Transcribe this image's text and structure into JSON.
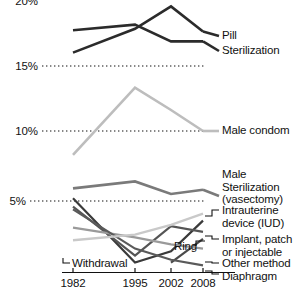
{
  "chart_data": {
    "type": "line",
    "title": "",
    "xlabel": "",
    "ylabel": "",
    "x": [
      1982,
      1995,
      2002,
      2008
    ],
    "xtick_labels": [
      "1982",
      "1995",
      "2002",
      "2008"
    ],
    "ytick_labels": [
      "20%",
      "15%",
      "10%",
      "5%"
    ],
    "ytick_values": [
      20,
      15,
      10,
      5
    ],
    "ylim": [
      0,
      20.2
    ],
    "xlim": [
      1982,
      2008
    ],
    "grid": "horizontal-dotted",
    "legend_position": "right-inline-labels",
    "series": [
      {
        "name": "Pill",
        "label": "Pill",
        "color": "#2b2b2b",
        "width": 2.6,
        "values": [
          15.6,
          17.3,
          18.9,
          17.1
        ]
      },
      {
        "name": "Sterilization",
        "label": "Sterilization",
        "color": "#2b2b2b",
        "width": 2.6,
        "values": [
          17.2,
          17.6,
          16.4,
          16.4
        ]
      },
      {
        "name": "Male condom",
        "label": "Male condom",
        "color": "#bdbdbd",
        "width": 2.6,
        "values": [
          8.3,
          13.1,
          11.5,
          10.0
        ]
      },
      {
        "name": "Male Sterilization (vasectomy)",
        "label": "Male\nSterilization\n(vasectomy)",
        "color": "#7a7a7a",
        "width": 2.6,
        "values": [
          5.9,
          6.4,
          5.5,
          5.8
        ]
      },
      {
        "name": "Intrauterine device (IUD)",
        "label": "Intrauterine\ndevice (IUD)",
        "color": "#3a3a3a",
        "width": 2.2,
        "values": [
          5.2,
          0.6,
          1.4,
          3.6
        ]
      },
      {
        "name": "Implant, patch or injectable",
        "label": "Implant, patch\nor injectable",
        "color": "#555555",
        "width": 2.2,
        "values": [
          4.6,
          1.1,
          3.2,
          2.8
        ]
      },
      {
        "name": "Ring",
        "label": "Ring",
        "color": "#4a4a4a",
        "width": 2.2,
        "values": [
          0.0,
          0.0,
          0.6,
          2.3
        ]
      },
      {
        "name": "Other method",
        "label": "Other method",
        "color": "#9a9a9a",
        "width": 2.2,
        "values": [
          3.1,
          2.4,
          1.9,
          1.6
        ]
      },
      {
        "name": "Diaphragm",
        "label": "Diaphragm",
        "color": "#5a5a5a",
        "width": 2.2,
        "values": [
          4.4,
          1.6,
          0.8,
          0.4
        ]
      },
      {
        "name": "Withdrawal",
        "label": "Withdrawal",
        "color": "#c9c9c9",
        "width": 2.4,
        "values": [
          2.2,
          2.6,
          3.3,
          4.1
        ]
      }
    ]
  },
  "axis": {
    "y_labels": [
      "20%",
      "15%",
      "10%",
      "5%"
    ],
    "x_labels": [
      "1982",
      "1995",
      "2002",
      "2008"
    ]
  },
  "labels": {
    "pill": "Pill",
    "sterilization": "Sterilization",
    "male_condom": "Male condom",
    "male_sterilization": "Male\nSterilization\n(vasectomy)",
    "iud": "Intrauterine\ndevice (IUD)",
    "implant": "Implant, patch\nor injectable",
    "ring": "Ring",
    "other_method": "Other method",
    "diaphragm": "Diaphragm",
    "withdrawal": "Withdrawal"
  }
}
